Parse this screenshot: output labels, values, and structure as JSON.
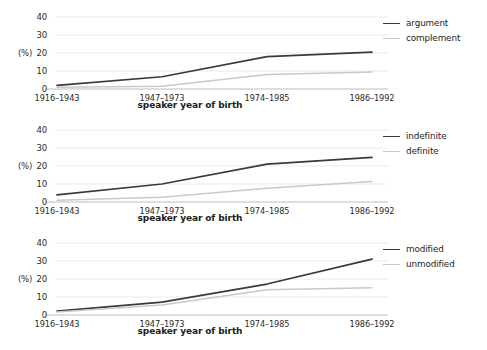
{
  "figure": {
    "width": 487,
    "height": 350,
    "background": "#ffffff",
    "series_colors": {
      "dark": "#3a3a3a",
      "light": "#c9c9c9",
      "gridline": "#ebebeb",
      "axis": "#bdbdbd",
      "text": "#1c1c1c"
    }
  },
  "shared": {
    "categories": [
      "1916–1943",
      "1947–1973",
      "1974–1985",
      "1986–1992"
    ],
    "xlabel": "speaker year of birth",
    "ylabel": "(%)",
    "yticks": [
      "40",
      "30",
      "20",
      "10",
      "0"
    ],
    "ylim": [
      0,
      40
    ]
  },
  "chart_data": [
    {
      "type": "line",
      "panel": 1,
      "title": "",
      "xlabel": "speaker year of birth",
      "ylabel": "(%)",
      "categories": [
        "1916–1943",
        "1947–1973",
        "1974–1985",
        "1986–1992"
      ],
      "ylim": [
        0,
        40
      ],
      "yticks": [
        0,
        10,
        20,
        30,
        40
      ],
      "grid": true,
      "legend_position": "right",
      "series": [
        {
          "name": "argument",
          "color": "#3a3a3a",
          "values": [
            2.0,
            6.8,
            18.0,
            20.5
          ]
        },
        {
          "name": "complement",
          "color": "#c9c9c9",
          "values": [
            1.0,
            1.5,
            8.0,
            9.5
          ]
        }
      ]
    },
    {
      "type": "line",
      "panel": 2,
      "title": "",
      "xlabel": "speaker year of birth",
      "ylabel": "(%)",
      "categories": [
        "1916–1943",
        "1947–1973",
        "1974–1985",
        "1986–1992"
      ],
      "ylim": [
        0,
        40
      ],
      "yticks": [
        0,
        10,
        20,
        30,
        40
      ],
      "grid": true,
      "legend_position": "right",
      "series": [
        {
          "name": "indefinite",
          "color": "#3a3a3a",
          "values": [
            4.0,
            10.0,
            21.0,
            24.8
          ]
        },
        {
          "name": "definite",
          "color": "#c9c9c9",
          "values": [
            1.0,
            2.6,
            7.6,
            11.4
          ]
        }
      ]
    },
    {
      "type": "line",
      "panel": 3,
      "title": "",
      "xlabel": "speaker year of birth",
      "ylabel": "(%)",
      "categories": [
        "1916–1943",
        "1947–1973",
        "1974–1985",
        "1986–1992"
      ],
      "ylim": [
        0,
        40
      ],
      "yticks": [
        0,
        10,
        20,
        30,
        40
      ],
      "grid": true,
      "legend_position": "right",
      "series": [
        {
          "name": "modified",
          "color": "#3a3a3a",
          "values": [
            2.2,
            7.2,
            17.2,
            31.0
          ]
        },
        {
          "name": "unmodified",
          "color": "#c9c9c9",
          "values": [
            1.6,
            5.6,
            14.0,
            15.2
          ]
        }
      ]
    }
  ]
}
